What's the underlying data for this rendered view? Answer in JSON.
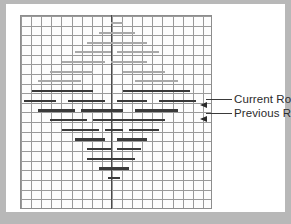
{
  "figure": {
    "type": "grid-diagram",
    "background_color": "#b8b8b8",
    "card_color": "#ffffff",
    "grid": {
      "cols": 19,
      "rows": 20,
      "cell_width_px": 10.1,
      "cell_height_px": 9.65,
      "line_color": "#9a9a9a",
      "border_color": "#8d8d8d",
      "center_line_col": 9,
      "center_line_color": "#4a4a4a"
    },
    "bar_colors": {
      "past": "#a9a9a9",
      "active": "#3a3a3a"
    },
    "rows": [
      {
        "index": 0,
        "style": "light",
        "segments": [
          {
            "start": 9.0,
            "end": 10.2
          }
        ]
      },
      {
        "index": 1,
        "style": "light",
        "segments": [
          {
            "start": 7.8,
            "end": 11.4
          }
        ]
      },
      {
        "index": 2,
        "style": "light",
        "segments": [
          {
            "start": 6.6,
            "end": 12.6
          }
        ]
      },
      {
        "index": 3,
        "style": "light",
        "segments": [
          {
            "start": 5.4,
            "end": 9.0
          },
          {
            "start": 9.6,
            "end": 13.8
          }
        ]
      },
      {
        "index": 4,
        "style": "light",
        "segments": [
          {
            "start": 4.2,
            "end": 8.4
          },
          {
            "start": 9.0,
            "end": 12.6
          }
        ]
      },
      {
        "index": 5,
        "style": "light",
        "segments": [
          {
            "start": 3.0,
            "end": 7.2
          },
          {
            "start": 10.2,
            "end": 14.4
          }
        ]
      },
      {
        "index": 6,
        "style": "light",
        "segments": [
          {
            "start": 1.8,
            "end": 6.0
          },
          {
            "start": 11.4,
            "end": 15.6
          }
        ]
      },
      {
        "index": 7,
        "style": "dark",
        "label": "current_row",
        "segments": [
          {
            "start": 1.2,
            "end": 7.2
          },
          {
            "start": 10.2,
            "end": 16.8
          }
        ]
      },
      {
        "index": 8,
        "style": "dark",
        "label": "previous_row",
        "segments": [
          {
            "start": 0.4,
            "end": 3.6
          },
          {
            "start": 4.8,
            "end": 8.4
          },
          {
            "start": 9.6,
            "end": 12.6
          },
          {
            "start": 13.8,
            "end": 17.4
          }
        ]
      },
      {
        "index": 9,
        "style": "dark",
        "segments": [
          {
            "start": 1.8,
            "end": 5.4
          },
          {
            "start": 6.0,
            "end": 10.2
          },
          {
            "start": 11.4,
            "end": 15.6
          }
        ]
      },
      {
        "index": 10,
        "style": "dark",
        "segments": [
          {
            "start": 3.0,
            "end": 6.6
          },
          {
            "start": 7.2,
            "end": 10.8
          },
          {
            "start": 10.8,
            "end": 14.4
          }
        ]
      },
      {
        "index": 11,
        "style": "dark",
        "segments": [
          {
            "start": 4.2,
            "end": 7.8
          },
          {
            "start": 8.4,
            "end": 10.2
          },
          {
            "start": 10.8,
            "end": 13.8
          }
        ]
      },
      {
        "index": 12,
        "style": "dark",
        "segments": [
          {
            "start": 5.4,
            "end": 8.4
          },
          {
            "start": 9.6,
            "end": 12.6
          }
        ]
      },
      {
        "index": 13,
        "style": "dark",
        "segments": [
          {
            "start": 6.6,
            "end": 9.0
          },
          {
            "start": 9.6,
            "end": 12.0
          }
        ]
      },
      {
        "index": 14,
        "style": "dark",
        "segments": [
          {
            "start": 6.6,
            "end": 11.4
          }
        ]
      },
      {
        "index": 15,
        "style": "dark",
        "segments": [
          {
            "start": 7.8,
            "end": 10.8
          }
        ]
      },
      {
        "index": 16,
        "style": "dark",
        "segments": [
          {
            "start": 8.7,
            "end": 9.9
          }
        ]
      }
    ]
  },
  "annotations": {
    "current_row": {
      "label": "Current Row",
      "arrow": "arrow-left"
    },
    "previous_row": {
      "label": "Previous Row",
      "arrow": "arrow-left"
    }
  }
}
